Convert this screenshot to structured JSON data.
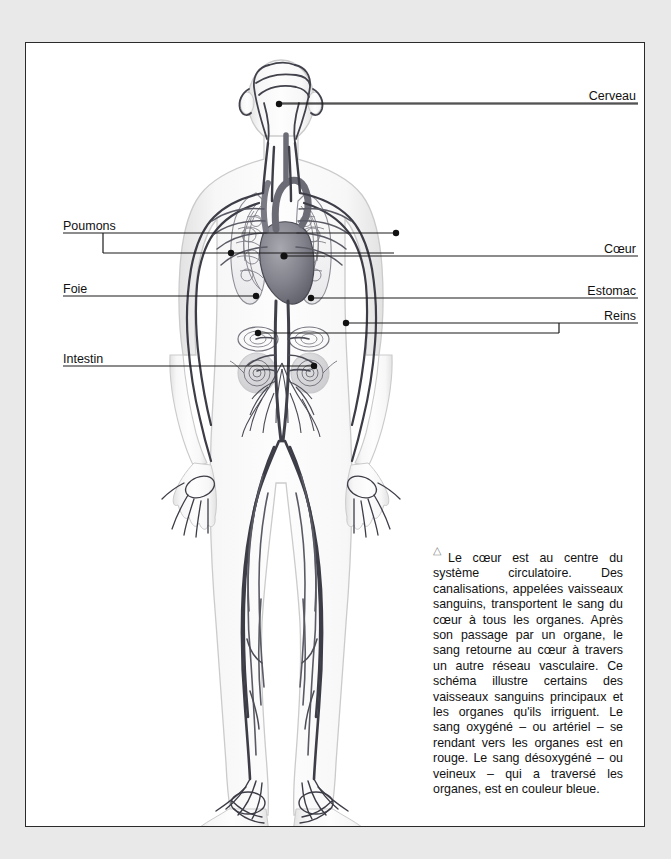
{
  "page": {
    "background_color": "#e9e9e9",
    "plate_background": "#ffffff",
    "border_color": "#2b2b2b"
  },
  "figure": {
    "style": "grayscale line illustration"
  },
  "labels": [
    {
      "id": "cerveau",
      "text": "Cerveau",
      "side": "right",
      "x": 557,
      "y": 86,
      "underline_from": 335,
      "underline_to": 612
    },
    {
      "id": "poumons",
      "text": "Poumons",
      "side": "left",
      "x": 62,
      "y": 212,
      "underline_from": 62,
      "underline_to": 612
    },
    {
      "id": "coeur",
      "text": "Cœur",
      "side": "right",
      "x": 572,
      "y": 239,
      "underline_from": 330,
      "underline_to": 612
    },
    {
      "id": "foie",
      "text": "Foie",
      "side": "left",
      "x": 62,
      "y": 280,
      "underline_from": 62,
      "underline_to": 612
    },
    {
      "id": "estomac",
      "text": "Estomac",
      "side": "right",
      "x": 555,
      "y": 281,
      "underline_from": 340,
      "underline_to": 612
    },
    {
      "id": "reins",
      "text": "Reins",
      "side": "right",
      "x": 573,
      "y": 306,
      "underline_from": 330,
      "underline_to": 612
    },
    {
      "id": "intestin",
      "text": "Intestin",
      "side": "left",
      "x": 62,
      "y": 349,
      "underline_from": 62,
      "underline_to": 612
    }
  ],
  "caption": {
    "marker": "triangle",
    "text": "Le cœur est au centre du système circulatoire. Des canalisations, appelées vaisseaux sanguins, transportent le sang du cœur à tous les organes. Après son passage par un organe, le sang retourne au cœur à travers un autre réseau vasculaire. Ce schéma illustre certains des vaisseaux sanguins principaux et les organes qu'ils irriguent. Le sang oxygéné – ou artériel – se rendant vers les organes est en rouge. Le sang désoxygéné – ou veineux – qui a traversé les organes, est en couleur bleue."
  },
  "colors": {
    "text": "#111111",
    "leader_line": "#1a1a1a",
    "vessel_dark": "#3b3b42",
    "vessel_mid": "#6e6e76",
    "vessel_light": "#a9a9b0",
    "body_fill": "#f4f4f4",
    "body_outline": "#cfcfcf",
    "organ_fill": "#8e8e96",
    "triangle": "#8a8a8a"
  }
}
